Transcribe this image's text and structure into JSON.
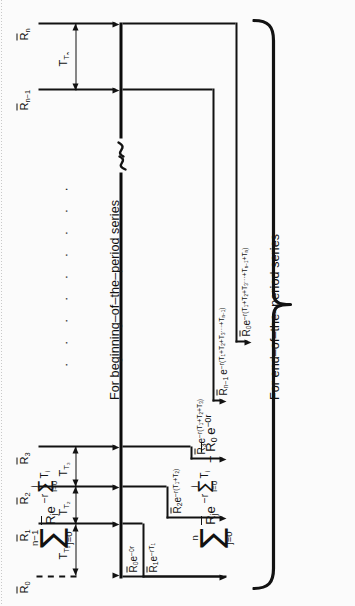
{
  "figure": {
    "type": "cash-flow-timeline-diagram",
    "orientation": "rotated-90-ccw",
    "axis_name": "time-axis",
    "break_symbol": "squiggle-break"
  },
  "cash_flows": [
    {
      "id": "R0",
      "label": "R̄₀",
      "base": "R",
      "bar": true,
      "sub": "0",
      "interval_after": "T₁",
      "style": "dashed"
    },
    {
      "id": "R1",
      "label": "R̄₁",
      "base": "R",
      "bar": true,
      "sub": "1",
      "interval_after": "T₂",
      "style": "solid"
    },
    {
      "id": "R2",
      "label": "R̄₂",
      "base": "R",
      "bar": true,
      "sub": "2",
      "interval_after": "T₃",
      "style": "solid"
    },
    {
      "id": "R3",
      "label": "R̄₃",
      "base": "R",
      "bar": true,
      "sub": "3",
      "interval_after": "",
      "style": "solid"
    },
    {
      "id": "Rn-1",
      "label": "R̄ₙ₋₁",
      "base": "R",
      "bar": true,
      "sub": "n−1",
      "interval_after": "Tₙ",
      "style": "solid"
    },
    {
      "id": "Rn",
      "label": "R̄ₙ",
      "base": "R",
      "bar": true,
      "sub": "n",
      "interval_after": "",
      "style": "solid"
    }
  ],
  "intervals": [
    {
      "id": "T1",
      "label": "T₁"
    },
    {
      "id": "T2",
      "label": "T₂"
    },
    {
      "id": "T3",
      "label": "T₃"
    },
    {
      "id": "Tn",
      "label": "Tₙ"
    }
  ],
  "discount_terms": [
    {
      "id": "term-R0-0r",
      "text": "R̄0e⁻⁰ʳ",
      "plain": "R0 e^(-0r)"
    },
    {
      "id": "term-R1",
      "text": "R̄1e⁻ʳᵀ₁",
      "plain": "R1 e^(-rT1)"
    },
    {
      "id": "term-R2",
      "text": "R̄2e⁻ʳ(T1+T2)",
      "plain": "R2 e^(-r(T1+T2))"
    },
    {
      "id": "term-R3",
      "text": "R̄3e⁻ʳ(T1+T2+T3)",
      "plain": "R3 e^(-r(T1+T2+T3))"
    },
    {
      "id": "term-Rn-1",
      "text": "R̄n-1 e⁻ʳ(T1+T2+T3···+Tn-1)",
      "plain": "Rn-1 e^(-r(T1+T2+T3...+Tn-1))"
    },
    {
      "id": "term-R0-all",
      "text": "R̄0e⁻ʳ(T1+T2+T3···+Tn-1+Tn)",
      "plain": "R0 e^(-r(T1+T2+T3...+Tn-1+Tn))"
    }
  ],
  "formulas": [
    {
      "id": "beginning-of-period",
      "upper_limit": "n−1",
      "sigma": "∑",
      "lower_limit": "j=0",
      "body_lead": "R̄",
      "body_sub": "j",
      "body_e": "e",
      "exp_minus_r": "−r",
      "inner_upper": "j",
      "inner_sigma": "∑",
      "inner_lower": "i=0",
      "inner_term": "T",
      "inner_term_sub": "i",
      "tail": "",
      "caption": "For beginning–of–the–period series"
    },
    {
      "id": "end-of-period",
      "upper_limit": "n",
      "sigma": "∑",
      "lower_limit": "j=0",
      "body_lead": "R̄",
      "body_sub": "j",
      "body_e": "e",
      "exp_minus_r": "−r",
      "inner_upper": "j",
      "inner_sigma": "∑",
      "inner_lower": "i=0",
      "inner_term": "T",
      "inner_term_sub": "i",
      "tail": "− R̄0 e⁻⁰ʳ",
      "caption": "For end–of–the–period series"
    }
  ],
  "ellipsis": {
    "dots": "· · · · · · · · ·"
  },
  "colors": {
    "ink": "#121212",
    "paper": "#fbfbfb"
  }
}
